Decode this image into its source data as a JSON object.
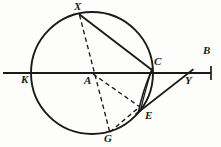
{
  "figure": {
    "width": 221,
    "height": 147,
    "background_color": "#fdfdfc",
    "ink_color": "#1a1a1a"
  },
  "labels": {
    "X": "X",
    "K": "K",
    "A": "A",
    "C": "C",
    "B": "B",
    "Y": "Y",
    "E": "E",
    "G": "G"
  },
  "points": {
    "X": {
      "x": 79,
      "y": 14,
      "label_x": 74,
      "label_y": 1
    },
    "K": {
      "x": 31,
      "y": 73,
      "label_x": 22,
      "label_y": 75
    },
    "A": {
      "x": 92,
      "y": 73,
      "label_x": 84,
      "label_y": 76
    },
    "C": {
      "x": 152,
      "y": 70,
      "label_x": 154,
      "label_y": 58
    },
    "B": {
      "x": 211,
      "y": 73,
      "label_x": 203,
      "label_y": 47
    },
    "Y": {
      "x": 186,
      "y": 73,
      "label_x": 186,
      "label_y": 76
    },
    "E": {
      "x": 141,
      "y": 108,
      "label_x": 144,
      "label_y": 110
    },
    "G": {
      "x": 110,
      "y": 134,
      "label_x": 105,
      "label_y": 134
    }
  },
  "circle": {
    "center_x": 92,
    "center_y": 73,
    "radius": 61,
    "stroke_width": 1.9
  },
  "line_segments": [
    {
      "name": "secant-line-KB",
      "from": "K-extended",
      "style": "solid",
      "x1": 4,
      "y1": 73,
      "x2": 211,
      "y2": 73
    },
    {
      "name": "chord-XC",
      "from": "X",
      "to": "C",
      "style": "solid",
      "x1": 79,
      "y1": 14,
      "x2": 152,
      "y2": 70
    },
    {
      "name": "tangent-EY",
      "from": "E",
      "to": "Y",
      "style": "solid",
      "x1": 137,
      "y1": 113,
      "x2": 192,
      "y2": 70
    },
    {
      "name": "chord-XG",
      "from": "X",
      "to": "G",
      "style": "dashed",
      "x1": 79,
      "y1": 14,
      "x2": 110,
      "y2": 134
    },
    {
      "name": "radius-AE",
      "from": "A",
      "to": "E",
      "style": "dashed",
      "x1": 92,
      "y1": 73,
      "x2": 141,
      "y2": 108
    },
    {
      "name": "chord-GE",
      "from": "G",
      "to": "E",
      "style": "dashed",
      "x1": 110,
      "y1": 133,
      "x2": 141,
      "y2": 107
    }
  ],
  "arcs": [
    {
      "name": "arc-CE-inner",
      "from": "C",
      "to": "E",
      "style": "solid",
      "bulge": "left"
    }
  ],
  "tick_marks": [
    {
      "name": "endpoint-tick-B",
      "x": 211,
      "y_top": 66,
      "y_bottom": 80
    }
  ]
}
